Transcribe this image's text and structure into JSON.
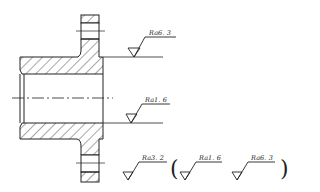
{
  "drawing": {
    "type": "section view of flanged sleeve",
    "line_color": "#222222",
    "roughness_callouts": [
      {
        "id": "top-face",
        "label": "Ra6. 3"
      },
      {
        "id": "bore",
        "label": "Ra1. 6"
      }
    ],
    "general_roughness": {
      "main": "Ra3. 2",
      "open_paren": "(",
      "others": [
        "Ra1. 6",
        "Ra6. 3"
      ],
      "close_paren": ")"
    }
  }
}
